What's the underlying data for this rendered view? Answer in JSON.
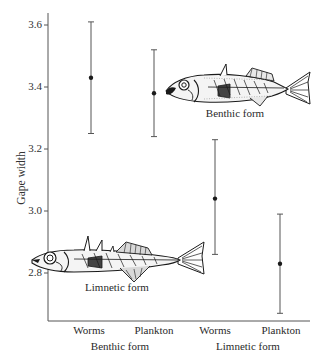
{
  "chart_data": {
    "type": "scatter",
    "title": "",
    "xlabel": "",
    "ylabel": "Gape width",
    "ylim": [
      2.62,
      3.64
    ],
    "yticks": [
      2.8,
      3.0,
      3.2,
      3.4,
      3.6
    ],
    "ytick_labels": [
      "2.8",
      "3.0",
      "3.2",
      "3.4",
      "3.6"
    ],
    "grid": false,
    "legend": null,
    "categories": [
      "Worms",
      "Plankton",
      "Worms",
      "Plankton"
    ],
    "groups": [
      {
        "label": "Benthic form",
        "categories": [
          "Worms",
          "Plankton"
        ]
      },
      {
        "label": "Limnetic form",
        "categories": [
          "Worms",
          "Plankton"
        ]
      }
    ],
    "series": [
      {
        "name": "Mean gape width with error bars",
        "points": [
          {
            "group": "Benthic form",
            "diet": "Worms",
            "mean": 3.43,
            "lower": 3.25,
            "upper": 3.61
          },
          {
            "group": "Benthic form",
            "diet": "Plankton",
            "mean": 3.38,
            "lower": 3.24,
            "upper": 3.52
          },
          {
            "group": "Limnetic form",
            "diet": "Worms",
            "mean": 3.04,
            "lower": 2.86,
            "upper": 3.23
          },
          {
            "group": "Limnetic form",
            "diet": "Plankton",
            "mean": 2.83,
            "lower": 2.67,
            "upper": 2.99
          }
        ]
      }
    ],
    "annotations": [
      {
        "text": "Benthic form",
        "type": "illustration-caption",
        "illustration": "benthic-stickleback-fish"
      },
      {
        "text": "Limnetic form",
        "type": "illustration-caption",
        "illustration": "limnetic-stickleback-fish"
      }
    ]
  },
  "labels": {
    "ylabel": "Gape width",
    "yticks": [
      "3.6",
      "3.4",
      "3.2",
      "3.0",
      "2.8"
    ],
    "categories": [
      "Worms",
      "Plankton",
      "Worms",
      "Plankton"
    ],
    "groups": [
      "Benthic form",
      "Limnetic form"
    ],
    "benthic_caption": "Benthic form",
    "limnetic_caption": "Limnetic form"
  },
  "colors": {
    "axis": "#555555",
    "errorbar": "#555555",
    "point": "#1a1a1a",
    "fish_ink": "#1a1a1a"
  }
}
